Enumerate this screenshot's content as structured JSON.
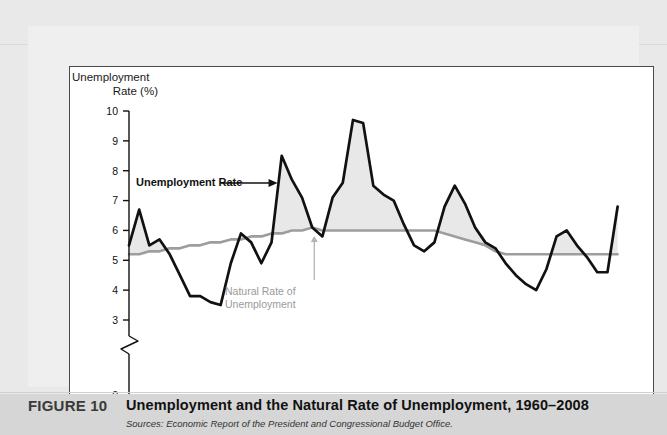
{
  "figure": {
    "number_label": "FIGURE 10",
    "title": "Unemployment and the Natural Rate of Unemployment, 1960–2008",
    "source": "Sources: Economic Report of the President and Congressional Budget Office."
  },
  "axis_title": {
    "line1": "Unemployment",
    "line2": "Rate (%)"
  },
  "annotations": {
    "unemployment_rate": "Unemployment Rate",
    "natural_rate_line1": "Natural Rate of",
    "natural_rate_line2": "Unemployment"
  },
  "colors": {
    "series_line": "#111111",
    "natural_line": "#9d9d9d",
    "fill": "#e8e8e8",
    "panel_bg": "#ffffff",
    "page_bg": "#e9e9e9",
    "caption_bg": "#d6d6d6"
  },
  "chart_data": {
    "type": "line",
    "title": "Unemployment and the Natural Rate of Unemployment, 1960–2008",
    "xlabel": "",
    "ylabel": "Unemployment Rate (%)",
    "xlim": [
      1960,
      2010
    ],
    "ylim": [
      0,
      10
    ],
    "y_axis_break": [
      0,
      3
    ],
    "grid": false,
    "legend": "annotations-inline",
    "xticks": [
      1960,
      1965,
      1970,
      1975,
      1980,
      1985,
      1990,
      1995,
      2000,
      2005,
      2010
    ],
    "yticks": [
      0,
      3,
      4,
      5,
      6,
      7,
      8,
      9,
      10
    ],
    "x": [
      1960,
      1961,
      1962,
      1963,
      1964,
      1965,
      1966,
      1967,
      1968,
      1969,
      1970,
      1971,
      1972,
      1973,
      1974,
      1975,
      1976,
      1977,
      1978,
      1979,
      1980,
      1981,
      1982,
      1983,
      1984,
      1985,
      1986,
      1987,
      1988,
      1989,
      1990,
      1991,
      1992,
      1993,
      1994,
      1995,
      1996,
      1997,
      1998,
      1999,
      2000,
      2001,
      2002,
      2003,
      2004,
      2005,
      2006,
      2007,
      2008
    ],
    "series": [
      {
        "name": "Unemployment Rate",
        "values": [
          5.5,
          6.7,
          5.5,
          5.7,
          5.2,
          4.5,
          3.8,
          3.8,
          3.6,
          3.5,
          4.9,
          5.9,
          5.6,
          4.9,
          5.6,
          8.5,
          7.7,
          7.1,
          6.1,
          5.8,
          7.1,
          7.6,
          9.7,
          9.6,
          7.5,
          7.2,
          7.0,
          6.2,
          5.5,
          5.3,
          5.6,
          6.8,
          7.5,
          6.9,
          6.1,
          5.6,
          5.4,
          4.9,
          4.5,
          4.2,
          4.0,
          4.7,
          5.8,
          6.0,
          5.5,
          5.1,
          4.6,
          4.6,
          6.8
        ],
        "color": "#111111",
        "style": "solid-thick"
      },
      {
        "name": "Natural Rate of Unemployment",
        "values": [
          5.2,
          5.2,
          5.3,
          5.3,
          5.4,
          5.4,
          5.5,
          5.5,
          5.6,
          5.6,
          5.7,
          5.7,
          5.8,
          5.8,
          5.9,
          5.9,
          6.0,
          6.0,
          6.1,
          6.0,
          6.0,
          6.0,
          6.0,
          6.0,
          6.0,
          6.0,
          6.0,
          6.0,
          6.0,
          6.0,
          6.0,
          5.9,
          5.8,
          5.7,
          5.6,
          5.5,
          5.3,
          5.2,
          5.2,
          5.2,
          5.2,
          5.2,
          5.2,
          5.2,
          5.2,
          5.2,
          5.2,
          5.2,
          5.2
        ],
        "color": "#9d9d9d",
        "style": "solid-medium"
      }
    ],
    "fill_between": {
      "between": [
        "Unemployment Rate",
        "Natural Rate of Unemployment"
      ],
      "color": "#e8e8e8",
      "note": "shaded where unemployment rate exceeds the natural rate"
    },
    "annotation_points": [
      {
        "label": "Unemployment Rate",
        "arrow_to_year": 1975
      },
      {
        "label": "Natural Rate of Unemployment",
        "arrow_to_year": 1978
      }
    ]
  }
}
